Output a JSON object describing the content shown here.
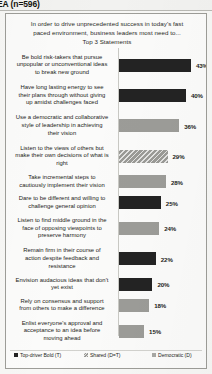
{
  "header": {
    "title": "EA (n=596)"
  },
  "chart_title": {
    "line1": "In order to drive unprecedented success in today's fast",
    "line2": "paced environment, business leaders most need to...",
    "line3": "Top 3 Statements"
  },
  "legend": {
    "items": [
      {
        "label": "Top-driver Bold (T)",
        "key": "bold",
        "color": "#232323"
      },
      {
        "label": "Shared (D=T)",
        "key": "shared",
        "color": "#9a9a96"
      },
      {
        "label": "Democratic (D)",
        "key": "democratic",
        "color": "#a8a8a4"
      }
    ]
  },
  "chart_data": {
    "type": "bar",
    "orientation": "horizontal",
    "title": "In order to drive unprecedented success in today's fast paced environment, business leaders most need to... Top 3 Statements",
    "xlabel": "",
    "ylabel": "",
    "xlim": [
      0,
      50
    ],
    "grid": false,
    "legend_position": "bottom",
    "sample_size": "n=596",
    "value_suffix": "%",
    "categories": [
      "Be bold risk-takers  that pursue unpopular or unconventional ideas to break new ground",
      "Have long lasting energy to see their plans through without giving up amidst challenges faced",
      "Use a democratic and collaborative style of leadership  in achieving their vision",
      "Listen to the views of others but make their own decisions of what is right",
      "Take incremental steps to cautiously implement their vision",
      "Dare to be different and willing to challenge  general opinion",
      "Listen to find middle ground in the face of opposing viewpoints  to preserve harmony",
      "Remain firm in their course of action despite feedback and resistance",
      "Envision audacious ideas that don't yet exist",
      "Rely on consensus and support from others to make a difference",
      "Enlist everyone's approval and acceptance to an idea before moving ahead"
    ],
    "values": [
      43,
      40,
      36,
      29,
      28,
      25,
      24,
      22,
      20,
      18,
      15
    ],
    "value_labels": [
      "43%",
      "40%",
      "36%",
      "29%",
      "28%",
      "25%",
      "24%",
      "22%",
      "20%",
      "18%",
      "15%"
    ],
    "series_keys": [
      "bold",
      "bold",
      "democratic",
      "shared",
      "democratic",
      "bold",
      "democratic",
      "bold",
      "bold",
      "democratic",
      "democratic"
    ],
    "label_lines": [
      [
        "Be bold risk-takers  that pursue",
        "unpopular or unconventional ideas",
        "to break new ground"
      ],
      [
        "Have long lasting energy to see",
        "their plans through without giving",
        "up amidst challenges faced"
      ],
      [
        "Use a democratic and collaborative",
        "style of leadership  in achieving",
        "their vision"
      ],
      [
        "Listen to the views of others but",
        "make their own decisions of what is",
        "right"
      ],
      [
        "Take incremental steps to",
        "cautiously implement their vision"
      ],
      [
        "Dare to be different and willing to",
        "challenge  general opinion"
      ],
      [
        "Listen to find middle ground in the",
        "face of opposing viewpoints  to",
        "preserve harmony"
      ],
      [
        "Remain firm in their course of",
        "action despite feedback and",
        "resistance"
      ],
      [
        "Envision audacious ideas that don't",
        "yet exist"
      ],
      [
        "Rely on consensus and support",
        "from others to make a difference"
      ],
      [
        "Enlist everyone's approval and",
        "acceptance to an idea before",
        "moving ahead"
      ]
    ]
  }
}
